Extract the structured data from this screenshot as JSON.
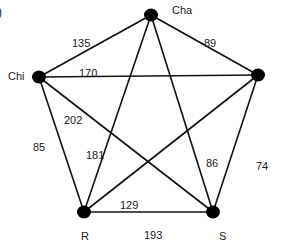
{
  "panel_label": ")",
  "colors": {
    "edge": "#111111",
    "node": "#000000",
    "text": "#1a1a1a"
  },
  "nodes": [
    {
      "id": "Cha",
      "label": "Cha",
      "x": 151,
      "y": 15,
      "lx": 172,
      "ly": 5
    },
    {
      "id": "E",
      "label": "",
      "x": 258,
      "y": 75,
      "lx": 270,
      "ly": 70
    },
    {
      "id": "Chi",
      "label": "Chi",
      "x": 39,
      "y": 77,
      "lx": 8,
      "ly": 71
    },
    {
      "id": "R",
      "label": "R",
      "x": 84,
      "y": 212,
      "lx": 81,
      "ly": 231
    },
    {
      "id": "S",
      "label": "S",
      "x": 213,
      "y": 212,
      "lx": 219,
      "ly": 231
    }
  ],
  "edges": [
    {
      "from": "Chi",
      "to": "Cha",
      "weight": "135",
      "lx": 72,
      "ly": 38
    },
    {
      "from": "Cha",
      "to": "E",
      "weight": "89",
      "lx": 204,
      "ly": 38
    },
    {
      "from": "Chi",
      "to": "E",
      "weight": "170",
      "lx": 79,
      "ly": 68
    },
    {
      "from": "Chi",
      "to": "S",
      "weight": "202",
      "lx": 64,
      "ly": 115
    },
    {
      "from": "Chi",
      "to": "R",
      "weight": "85",
      "lx": 33,
      "ly": 142
    },
    {
      "from": "Cha",
      "to": "R",
      "weight": "181",
      "lx": 86,
      "ly": 150
    },
    {
      "from": "Cha",
      "to": "S",
      "weight": "86",
      "lx": 206,
      "ly": 158
    },
    {
      "from": "E",
      "to": "S",
      "weight": "74",
      "lx": 256,
      "ly": 161
    },
    {
      "from": "E",
      "to": "R",
      "weight": "129",
      "lx": 120,
      "ly": 200
    },
    {
      "from": "R",
      "to": "S",
      "weight": "193",
      "lx": 144,
      "ly": 230
    }
  ]
}
